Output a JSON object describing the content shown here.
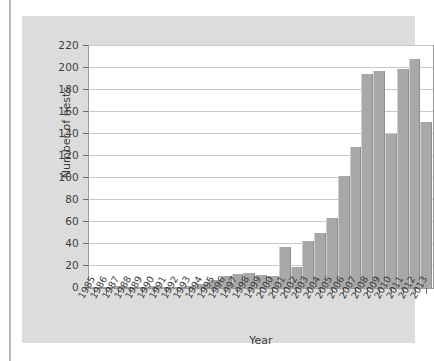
{
  "chart_data": {
    "type": "bar",
    "title": "",
    "xlabel": "Year",
    "ylabel": "Number of nests",
    "categories": [
      "1985",
      "1986",
      "1987",
      "1988",
      "1989",
      "1990",
      "1991",
      "1992",
      "1993",
      "1994",
      "1995",
      "1996",
      "1997",
      "1998",
      "1999",
      "2000",
      "2001",
      "2002",
      "2003",
      "2004",
      "2005",
      "2006",
      "2007",
      "2008",
      "2009",
      "2010",
      "2011",
      "2012",
      "2013"
    ],
    "values": [
      1,
      1,
      2,
      1,
      1,
      2,
      1,
      1,
      2,
      4,
      7,
      11,
      13,
      14,
      12,
      11,
      37,
      19,
      43,
      50,
      64,
      102,
      128,
      195,
      197,
      140,
      199,
      208,
      151
    ],
    "ylim": [
      0,
      220
    ],
    "yticks": [
      0,
      20,
      40,
      60,
      80,
      100,
      120,
      140,
      160,
      180,
      200,
      220
    ],
    "ytick_labels": [
      "0",
      "20",
      "40",
      "60",
      "80",
      "100",
      "120",
      "140",
      "160",
      "180",
      "200",
      "220"
    ],
    "grid": true,
    "legend": false,
    "bar_color": "#a8a8a8",
    "plot_background": "#ffffff",
    "figure_background": "#dcdcdc",
    "grid_color": "#c8c8c8",
    "axis_color": "#6e6e6e",
    "text_color": "#3c3c3c"
  }
}
